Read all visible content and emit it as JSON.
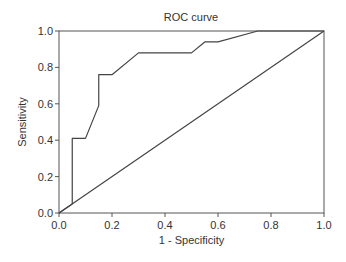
{
  "chart_data": {
    "type": "line",
    "title": "ROC curve",
    "xlabel": "1 - Specificity",
    "ylabel": "Sensitivity",
    "xlim": [
      0,
      1
    ],
    "ylim": [
      0,
      1
    ],
    "grid": false,
    "legend": null,
    "x_ticks": [
      "0.0",
      "0.2",
      "0.4",
      "0.6",
      "0.8",
      "1.0"
    ],
    "y_ticks": [
      "0.0",
      "0.2",
      "0.4",
      "0.6",
      "0.8",
      "1.0"
    ],
    "series": [
      {
        "name": "ROC",
        "x": [
          0.0,
          0.05,
          0.05,
          0.1,
          0.15,
          0.15,
          0.2,
          0.3,
          0.5,
          0.55,
          0.6,
          0.75,
          1.0
        ],
        "y": [
          0.0,
          0.05,
          0.41,
          0.41,
          0.59,
          0.76,
          0.76,
          0.88,
          0.88,
          0.94,
          0.94,
          1.0,
          1.0
        ]
      },
      {
        "name": "Reference line",
        "x": [
          0.0,
          1.0
        ],
        "y": [
          0.0,
          1.0
        ]
      }
    ]
  }
}
